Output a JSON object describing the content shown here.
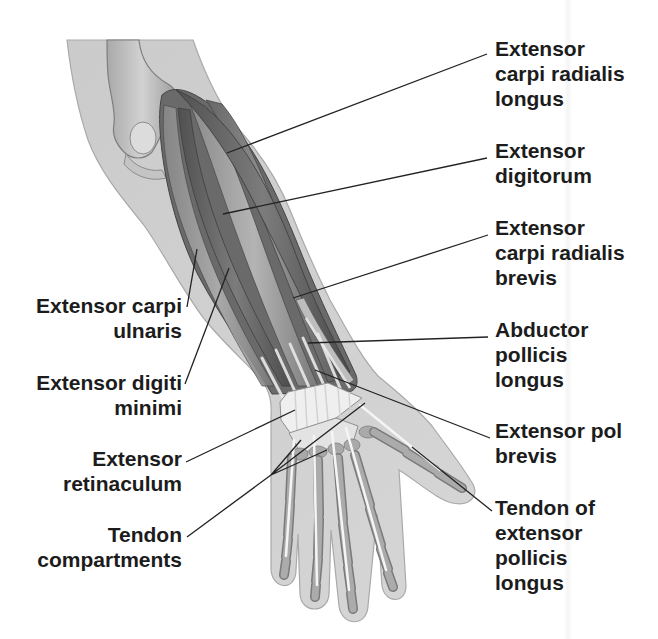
{
  "diagram": {
    "type": "anatomical-illustration"
  },
  "labels": {
    "right": [
      {
        "id": "extensor-carpi-radialis-longus",
        "lines": [
          "Extensor",
          "carpi radialis",
          "longus"
        ]
      },
      {
        "id": "extensor-digitorum",
        "lines": [
          "Extensor",
          "digitorum"
        ]
      },
      {
        "id": "extensor-carpi-radialis-brevis",
        "lines": [
          "Extensor",
          "carpi radialis",
          "brevis"
        ]
      },
      {
        "id": "abductor-pollicis-longus",
        "lines": [
          "Abductor",
          "pollicis",
          "longus"
        ]
      },
      {
        "id": "extensor-pol-brevis",
        "lines": [
          "Extensor pol",
          "brevis"
        ]
      },
      {
        "id": "tendon-of-extensor-pollicis-longus",
        "lines": [
          "Tendon of",
          "extensor",
          "pollicis",
          "longus"
        ]
      }
    ],
    "left": [
      {
        "id": "extensor-carpi-ulnaris",
        "lines": [
          "Extensor carpi",
          "ulnaris"
        ]
      },
      {
        "id": "extensor-digiti-minimi",
        "lines": [
          "Extensor digiti",
          "minimi"
        ]
      },
      {
        "id": "extensor-retinaculum",
        "lines": [
          "Extensor",
          "retinaculum"
        ]
      },
      {
        "id": "tendon-compartments",
        "lines": [
          "Tendon",
          "compartments"
        ]
      }
    ]
  },
  "colors": {
    "text": "#1c1c1c",
    "leader_line": "#222222",
    "skin": "#cfcfcf",
    "muscle": "#6e6e6e",
    "bone": "#a8a8a8",
    "tendon": "#f2f2f2",
    "background": "#ffffff"
  }
}
